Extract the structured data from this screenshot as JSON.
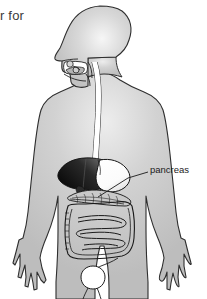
{
  "figure": {
    "title_fragment": "r for",
    "view": "anterior body silhouette with head in left profile",
    "style": "grayscale line drawing",
    "background_color": "#ffffff",
    "body_fill_color": "#c6c6c6",
    "body_fill_highlight": "#e6e6e6",
    "outline_color": "#2b2b2b",
    "organ_outline_color": "#1a1a1a",
    "labels": [
      {
        "text": "pancreas",
        "leader_from_x": 148,
        "leader_from_y": 172,
        "leader_to_x": 98,
        "leader_to_y": 196
      }
    ],
    "organs": [
      {
        "name": "mouth-cavity",
        "fill": "#ffffff",
        "tone": "white"
      },
      {
        "name": "tongue",
        "fill": "#bdbdbd",
        "tone": "gray"
      },
      {
        "name": "salivary-glands",
        "fill": "#d8d8d8",
        "tone": "light-gray"
      },
      {
        "name": "esophagus",
        "fill": "#ffffff",
        "tone": "white"
      },
      {
        "name": "liver",
        "fill": "#101010",
        "tone": "dark-gradient"
      },
      {
        "name": "stomach",
        "fill": "#ffffff",
        "tone": "white"
      },
      {
        "name": "pancreas",
        "fill": "#bfbfbf",
        "tone": "hatched-gray"
      },
      {
        "name": "small-intestine",
        "fill": "#ffffff",
        "tone": "white-coiled"
      },
      {
        "name": "large-intestine",
        "fill": "#f2f2f2",
        "tone": "off-white-frame"
      },
      {
        "name": "rectum-bladder",
        "fill": "#ffffff",
        "tone": "white"
      }
    ]
  }
}
